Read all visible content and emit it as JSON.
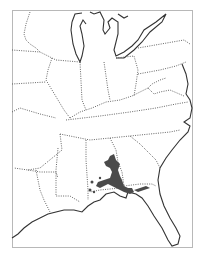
{
  "map": {
    "region": "Eastern United States",
    "frame_color": "#b8b8b8",
    "border_style": "dotted",
    "coast_color": "#333333",
    "range_color": "#4a4a4a",
    "legend": [],
    "labels": []
  }
}
